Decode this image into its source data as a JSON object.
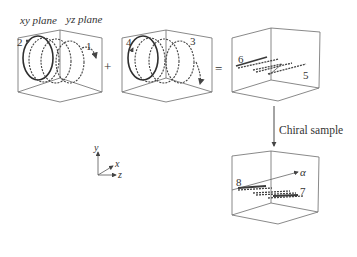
{
  "panels": {
    "panel1": {
      "header_left": "xy plane",
      "header_right": "yz plane",
      "labels": [
        "2",
        "1"
      ]
    },
    "operator_plus": "+",
    "panel2": {
      "labels": [
        "4",
        "3"
      ]
    },
    "operator_equals": "=",
    "panel3": {
      "labels": [
        "6",
        "5"
      ]
    },
    "arrow_label": "Chiral sample",
    "panel4": {
      "labels": [
        "8",
        "7"
      ],
      "axis_label": "α"
    }
  },
  "axes": {
    "y": "y",
    "x": "x",
    "z": "z"
  },
  "colors": {
    "line": "#2f2f2f",
    "box": "#6b6b6b",
    "text": "#333333"
  }
}
